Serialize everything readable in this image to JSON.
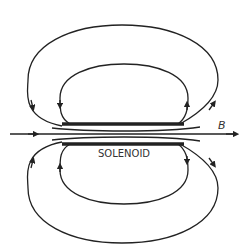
{
  "diagram": {
    "title_label": "SOLENOID",
    "field_label": "B",
    "colors": {
      "stroke": "#222222",
      "background": "#ffffff"
    }
  }
}
